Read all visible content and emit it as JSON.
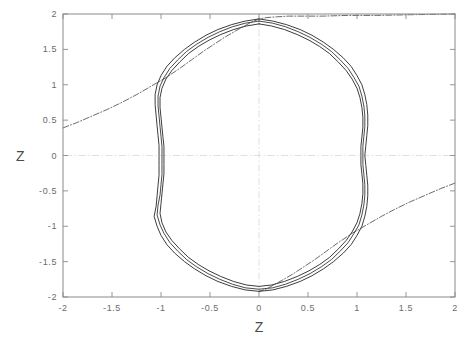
{
  "chart_data": {
    "type": "line",
    "title": "",
    "subtitle": "",
    "xlabel": "Z",
    "ylabel": "Z",
    "xlim": [
      -2,
      2
    ],
    "ylim": [
      -2,
      2
    ],
    "grid": false,
    "legend": null,
    "legend_position": "none",
    "annotations": [],
    "xticks": [
      -2,
      -1.5,
      -1,
      -0.5,
      0,
      0.5,
      1,
      1.5,
      2
    ],
    "xtick_labels": [
      "-2",
      "-1.5",
      "-1",
      "-0.5",
      "0",
      "0.5",
      "1",
      "1.5",
      "2"
    ],
    "yticks": [
      -2,
      -1.5,
      -1,
      -0.5,
      0,
      0.5,
      1,
      1.5,
      2
    ],
    "ytick_labels": [
      "-2",
      "-1.5",
      "-1",
      "-0.5",
      "0",
      "0.5",
      "1",
      "1.5",
      "2"
    ],
    "reference_lines": [
      {
        "name": "vertical-zero-line",
        "axis": "x",
        "value": 0,
        "style": "dash-dot",
        "color": "#d8d8d8"
      },
      {
        "name": "horizontal-zero-line",
        "axis": "y",
        "value": 0,
        "style": "dash-dot",
        "color": "#d8d8d8"
      }
    ],
    "series": [
      {
        "name": "closed-orbit-outer",
        "color": "#1a1a1a",
        "style": "solid",
        "closed": true,
        "points": [
          [
            0.0,
            1.93
          ],
          [
            0.14,
            1.9
          ],
          [
            0.28,
            1.85
          ],
          [
            0.42,
            1.78
          ],
          [
            0.54,
            1.7
          ],
          [
            0.66,
            1.6
          ],
          [
            0.76,
            1.5
          ],
          [
            0.86,
            1.38
          ],
          [
            0.94,
            1.26
          ],
          [
            1.0,
            1.13
          ],
          [
            1.05,
            1.0
          ],
          [
            1.08,
            0.86
          ],
          [
            1.1,
            0.72
          ],
          [
            1.11,
            0.57
          ],
          [
            1.11,
            0.42
          ],
          [
            1.1,
            0.28
          ],
          [
            1.09,
            0.14
          ],
          [
            1.08,
            0.0
          ],
          [
            1.09,
            -0.14
          ],
          [
            1.1,
            -0.28
          ],
          [
            1.11,
            -0.42
          ],
          [
            1.11,
            -0.57
          ],
          [
            1.1,
            -0.72
          ],
          [
            1.08,
            -0.86
          ],
          [
            1.05,
            -1.0
          ],
          [
            1.0,
            -1.13
          ],
          [
            0.94,
            -1.26
          ],
          [
            0.86,
            -1.38
          ],
          [
            0.76,
            -1.5
          ],
          [
            0.66,
            -1.6
          ],
          [
            0.54,
            -1.7
          ],
          [
            0.42,
            -1.78
          ],
          [
            0.28,
            -1.85
          ],
          [
            0.14,
            -1.9
          ],
          [
            0.0,
            -1.92
          ],
          [
            -0.14,
            -1.9
          ],
          [
            -0.28,
            -1.85
          ],
          [
            -0.42,
            -1.78
          ],
          [
            -0.54,
            -1.7
          ],
          [
            -0.66,
            -1.6
          ],
          [
            -0.76,
            -1.5
          ],
          [
            -0.86,
            -1.38
          ],
          [
            -0.94,
            -1.26
          ],
          [
            -1.0,
            -1.13
          ],
          [
            -1.04,
            -1.0
          ],
          [
            -1.07,
            -0.86
          ],
          [
            -1.05,
            -0.72
          ],
          [
            -1.04,
            -0.57
          ],
          [
            -1.03,
            -0.42
          ],
          [
            -1.02,
            -0.28
          ],
          [
            -1.02,
            -0.14
          ],
          [
            -1.02,
            0.0
          ],
          [
            -1.02,
            0.14
          ],
          [
            -1.03,
            0.28
          ],
          [
            -1.04,
            0.42
          ],
          [
            -1.05,
            0.57
          ],
          [
            -1.06,
            0.72
          ],
          [
            -1.06,
            0.86
          ],
          [
            -1.04,
            1.0
          ],
          [
            -1.0,
            1.13
          ],
          [
            -0.94,
            1.26
          ],
          [
            -0.86,
            1.38
          ],
          [
            -0.76,
            1.5
          ],
          [
            -0.66,
            1.6
          ],
          [
            -0.54,
            1.7
          ],
          [
            -0.42,
            1.78
          ],
          [
            -0.28,
            1.85
          ],
          [
            -0.14,
            1.9
          ],
          [
            0.0,
            1.93
          ]
        ]
      },
      {
        "name": "closed-orbit-inner",
        "color": "#1a1a1a",
        "style": "solid",
        "closed": true,
        "points": [
          [
            0.0,
            1.86
          ],
          [
            0.13,
            1.83
          ],
          [
            0.26,
            1.78
          ],
          [
            0.39,
            1.71
          ],
          [
            0.51,
            1.63
          ],
          [
            0.62,
            1.54
          ],
          [
            0.72,
            1.44
          ],
          [
            0.81,
            1.32
          ],
          [
            0.89,
            1.2
          ],
          [
            0.95,
            1.08
          ],
          [
            1.0,
            0.95
          ],
          [
            1.03,
            0.82
          ],
          [
            1.05,
            0.68
          ],
          [
            1.06,
            0.54
          ],
          [
            1.06,
            0.4
          ],
          [
            1.05,
            0.26
          ],
          [
            1.04,
            0.13
          ],
          [
            1.04,
            0.0
          ],
          [
            1.04,
            -0.13
          ],
          [
            1.05,
            -0.26
          ],
          [
            1.06,
            -0.4
          ],
          [
            1.06,
            -0.54
          ],
          [
            1.05,
            -0.68
          ],
          [
            1.03,
            -0.82
          ],
          [
            1.0,
            -0.95
          ],
          [
            0.95,
            -1.08
          ],
          [
            0.89,
            -1.2
          ],
          [
            0.81,
            -1.32
          ],
          [
            0.72,
            -1.44
          ],
          [
            0.62,
            -1.54
          ],
          [
            0.51,
            -1.63
          ],
          [
            0.39,
            -1.71
          ],
          [
            0.26,
            -1.78
          ],
          [
            0.13,
            -1.83
          ],
          [
            0.0,
            -1.85
          ],
          [
            -0.13,
            -1.83
          ],
          [
            -0.26,
            -1.78
          ],
          [
            -0.39,
            -1.71
          ],
          [
            -0.51,
            -1.63
          ],
          [
            -0.62,
            -1.54
          ],
          [
            -0.72,
            -1.44
          ],
          [
            -0.81,
            -1.32
          ],
          [
            -0.89,
            -1.2
          ],
          [
            -0.95,
            -1.08
          ],
          [
            -0.99,
            -0.95
          ],
          [
            -1.01,
            -0.82
          ],
          [
            -1.0,
            -0.68
          ],
          [
            -0.99,
            -0.54
          ],
          [
            -0.98,
            -0.4
          ],
          [
            -0.97,
            -0.26
          ],
          [
            -0.97,
            -0.13
          ],
          [
            -0.97,
            0.0
          ],
          [
            -0.97,
            0.13
          ],
          [
            -0.98,
            0.26
          ],
          [
            -0.99,
            0.4
          ],
          [
            -1.0,
            0.54
          ],
          [
            -1.01,
            0.68
          ],
          [
            -1.01,
            0.82
          ],
          [
            -0.99,
            0.95
          ],
          [
            -0.95,
            1.08
          ],
          [
            -0.89,
            1.2
          ],
          [
            -0.81,
            1.32
          ],
          [
            -0.72,
            1.44
          ],
          [
            -0.62,
            1.54
          ],
          [
            -0.51,
            1.63
          ],
          [
            -0.39,
            1.71
          ],
          [
            -0.26,
            1.78
          ],
          [
            -0.13,
            1.83
          ],
          [
            0.0,
            1.86
          ]
        ]
      },
      {
        "name": "closed-orbit-band",
        "color": "#2a2a2a",
        "style": "solid",
        "closed": true,
        "points": [
          [
            0.0,
            1.9
          ],
          [
            0.14,
            1.87
          ],
          [
            0.27,
            1.82
          ],
          [
            0.4,
            1.75
          ],
          [
            0.52,
            1.67
          ],
          [
            0.64,
            1.57
          ],
          [
            0.74,
            1.47
          ],
          [
            0.83,
            1.35
          ],
          [
            0.91,
            1.23
          ],
          [
            0.97,
            1.1
          ],
          [
            1.02,
            0.98
          ],
          [
            1.05,
            0.84
          ],
          [
            1.07,
            0.7
          ],
          [
            1.08,
            0.56
          ],
          [
            1.08,
            0.41
          ],
          [
            1.07,
            0.27
          ],
          [
            1.06,
            0.13
          ],
          [
            1.06,
            0.0
          ],
          [
            1.06,
            -0.13
          ],
          [
            1.07,
            -0.27
          ],
          [
            1.08,
            -0.41
          ],
          [
            1.08,
            -0.56
          ],
          [
            1.07,
            -0.7
          ],
          [
            1.05,
            -0.84
          ],
          [
            1.02,
            -0.98
          ],
          [
            0.97,
            -1.1
          ],
          [
            0.91,
            -1.23
          ],
          [
            0.83,
            -1.35
          ],
          [
            0.74,
            -1.47
          ],
          [
            0.64,
            -1.57
          ],
          [
            0.52,
            -1.67
          ],
          [
            0.4,
            -1.75
          ],
          [
            0.27,
            -1.82
          ],
          [
            0.14,
            -1.87
          ],
          [
            0.0,
            -1.89
          ],
          [
            -0.14,
            -1.87
          ],
          [
            -0.27,
            -1.82
          ],
          [
            -0.4,
            -1.75
          ],
          [
            -0.52,
            -1.67
          ],
          [
            -0.64,
            -1.57
          ],
          [
            -0.74,
            -1.47
          ],
          [
            -0.83,
            -1.35
          ],
          [
            -0.91,
            -1.23
          ],
          [
            -0.97,
            -1.1
          ],
          [
            -1.01,
            -0.98
          ],
          [
            -1.04,
            -0.84
          ],
          [
            -1.03,
            -0.7
          ],
          [
            -1.01,
            -0.56
          ],
          [
            -1.0,
            -0.41
          ],
          [
            -0.99,
            -0.27
          ],
          [
            -0.99,
            -0.13
          ],
          [
            -0.99,
            0.0
          ],
          [
            -0.99,
            0.13
          ],
          [
            -1.0,
            0.27
          ],
          [
            -1.01,
            0.41
          ],
          [
            -1.02,
            0.56
          ],
          [
            -1.03,
            0.7
          ],
          [
            -1.03,
            0.84
          ],
          [
            -1.01,
            0.98
          ],
          [
            -0.97,
            1.1
          ],
          [
            -0.91,
            1.23
          ],
          [
            -0.83,
            1.35
          ],
          [
            -0.74,
            1.47
          ],
          [
            -0.64,
            1.57
          ],
          [
            -0.52,
            1.67
          ],
          [
            -0.4,
            1.75
          ],
          [
            -0.27,
            1.82
          ],
          [
            -0.14,
            1.87
          ],
          [
            0.0,
            1.9
          ]
        ]
      },
      {
        "name": "separatrix-branch-upper-left",
        "color": "#3a3a3a",
        "style": "dash-dot",
        "closed": false,
        "points": [
          [
            -2.0,
            0.39
          ],
          [
            -1.85,
            0.47
          ],
          [
            -1.7,
            0.56
          ],
          [
            -1.55,
            0.65
          ],
          [
            -1.4,
            0.75
          ],
          [
            -1.25,
            0.86
          ],
          [
            -1.1,
            0.98
          ],
          [
            -0.95,
            1.1
          ],
          [
            -0.8,
            1.24
          ],
          [
            -0.68,
            1.36
          ],
          [
            -0.56,
            1.48
          ],
          [
            -0.45,
            1.58
          ],
          [
            -0.34,
            1.68
          ],
          [
            -0.24,
            1.76
          ],
          [
            -0.15,
            1.83
          ],
          [
            -0.07,
            1.89
          ],
          [
            0.0,
            1.93
          ],
          [
            0.08,
            1.95
          ],
          [
            0.18,
            1.96
          ],
          [
            0.3,
            1.97
          ],
          [
            0.45,
            1.97
          ],
          [
            0.65,
            1.97
          ],
          [
            0.9,
            1.98
          ],
          [
            1.2,
            1.98
          ],
          [
            1.55,
            1.99
          ],
          [
            2.0,
            2.0
          ]
        ]
      },
      {
        "name": "separatrix-branch-lower-right",
        "color": "#3a3a3a",
        "style": "dash-dot",
        "closed": false,
        "points": [
          [
            2.0,
            -0.39
          ],
          [
            1.85,
            -0.47
          ],
          [
            1.7,
            -0.56
          ],
          [
            1.55,
            -0.65
          ],
          [
            1.4,
            -0.75
          ],
          [
            1.25,
            -0.86
          ],
          [
            1.1,
            -0.98
          ],
          [
            0.95,
            -1.1
          ],
          [
            0.8,
            -1.24
          ],
          [
            0.68,
            -1.36
          ],
          [
            0.56,
            -1.48
          ],
          [
            0.45,
            -1.58
          ],
          [
            0.34,
            -1.68
          ],
          [
            0.24,
            -1.76
          ],
          [
            0.15,
            -1.83
          ],
          [
            0.07,
            -1.89
          ],
          [
            0.0,
            -1.92
          ]
        ]
      }
    ]
  },
  "axes": {
    "frame_color": "#8a8a8a",
    "tick_color": "#8a8a8a",
    "label_color": "#6b6b6b"
  }
}
